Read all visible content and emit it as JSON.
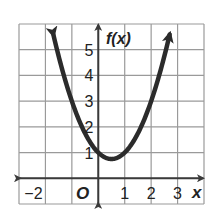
{
  "chart_data": {
    "type": "line",
    "title": "",
    "function": "f(x) = x^2 - x + 1",
    "xlabel": "x",
    "ylabel": "f(x)",
    "xlim": [
      -3,
      4
    ],
    "ylim": [
      -1,
      6
    ],
    "grid": true,
    "x_tick_labels": [
      "−2",
      "O",
      "1",
      "2",
      "3"
    ],
    "x_tick_values": [
      -2,
      0,
      1,
      2,
      3
    ],
    "y_tick_labels": [
      "1",
      "2",
      "3",
      "4",
      "5"
    ],
    "y_tick_values": [
      1,
      2,
      3,
      4,
      5
    ],
    "vertex": [
      0.5,
      0.75
    ],
    "y_intercept": 1,
    "series": [
      {
        "name": "f(x)",
        "x": [
          -1.7,
          -1.5,
          -1,
          -0.5,
          0,
          0.5,
          1,
          1.5,
          2,
          2.5,
          2.7
        ],
        "values": [
          5.59,
          4.75,
          3,
          1.75,
          1,
          0.75,
          1,
          1.75,
          3,
          4.75,
          5.59
        ]
      }
    ],
    "arrows_at_ends": true
  },
  "labels": {
    "x_axis": "x",
    "y_axis": "f(x)",
    "origin": "O",
    "xticks": [
      "−2",
      "1",
      "2",
      "3"
    ],
    "yticks": [
      "1",
      "2",
      "3",
      "4",
      "5"
    ]
  },
  "colors": {
    "grid": "#9a9a9a",
    "axis": "#3a3a3a",
    "curve": "#2b2b2b",
    "text": "#222222",
    "background": "#ffffff"
  }
}
